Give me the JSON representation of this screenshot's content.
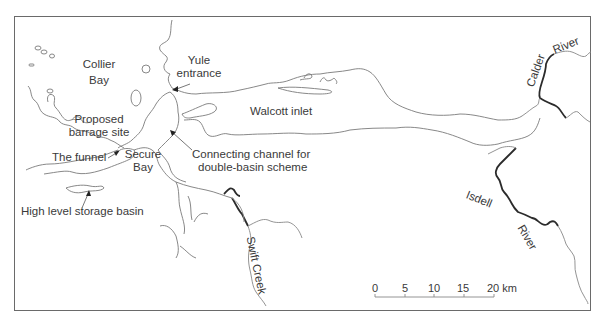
{
  "map": {
    "labels": {
      "collier_bay_1": "Collier",
      "collier_bay_2": "Bay",
      "yule_1": "Yule",
      "yule_2": "entrance",
      "walcott": "Walcott inlet",
      "proposed_1": "Proposed",
      "proposed_2": "barrage site",
      "funnel": "The funnel",
      "secure_1": "Secure",
      "secure_2": "Bay",
      "connecting_1": "Connecting channel for",
      "connecting_2": "double-basin scheme",
      "storage": "High level storage basin",
      "swift_creek": "Swift Creek",
      "calder": "Calder",
      "calder_river": "River",
      "isdell": "Isdell",
      "isdell_river": "River"
    },
    "scale_bar": {
      "ticks": [
        "0",
        "5",
        "10",
        "15",
        "20 km"
      ],
      "unit": "km",
      "max": 20
    },
    "colors": {
      "coastline": "#7a7a7a",
      "river_highlight": "#2b2b2b",
      "text": "#3a3a3a",
      "frame": "#6a6a6a"
    }
  }
}
